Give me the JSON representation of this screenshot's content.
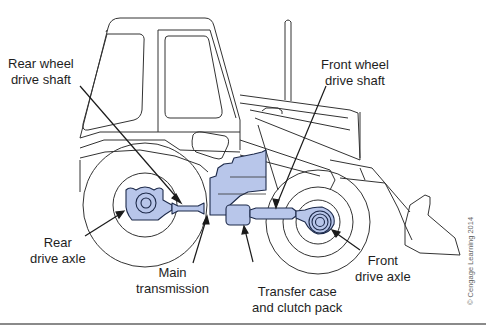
{
  "figure": {
    "colors": {
      "line": "#333333",
      "component_fill": "#b8c6ea",
      "component_stroke": "#1d2a4a",
      "leader": "#1a1a1a",
      "rule": "#8a8a8a"
    },
    "labels": {
      "rear_wheel_drive_shaft": [
        "Rear wheel",
        "drive shaft"
      ],
      "front_wheel_drive_shaft": [
        "Front wheel",
        "drive shaft"
      ],
      "rear_drive_axle": [
        "Rear",
        "drive axle"
      ],
      "main_transmission": [
        "Main",
        "transmission"
      ],
      "transfer_case": [
        "Transfer case",
        "and clutch pack"
      ],
      "front_drive_axle": [
        "Front",
        "drive axle"
      ]
    },
    "copyright": "© Cengage Learning 2014"
  }
}
